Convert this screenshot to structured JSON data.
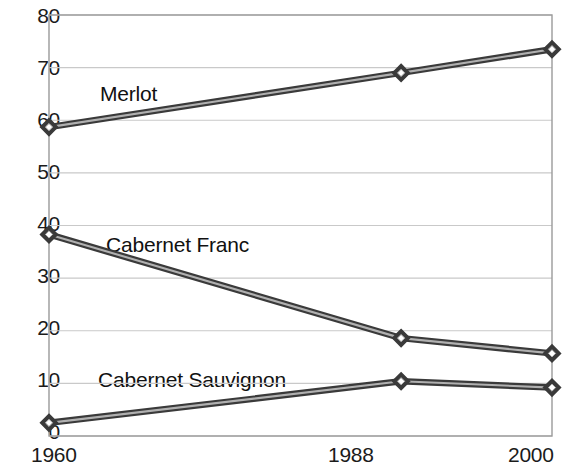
{
  "chart_data": {
    "type": "line",
    "title": "",
    "subtitle": "",
    "xlabel": "",
    "ylabel": "",
    "x": [
      1960,
      1988,
      2000
    ],
    "categories": [
      "1960",
      "1988",
      "2000"
    ],
    "xtick_labels": [
      "1960",
      "1988",
      "2000"
    ],
    "ytick_labels": [
      "0",
      "10",
      "20",
      "30",
      "40",
      "50",
      "60",
      "70",
      "80"
    ],
    "ytick_values": [
      0,
      10,
      20,
      30,
      40,
      50,
      60,
      70,
      80
    ],
    "ylim": [
      0,
      80
    ],
    "xlim": [
      1960,
      2000
    ],
    "grid": "horizontal",
    "legend": "inline-labels",
    "series": [
      {
        "name": "Merlot",
        "values": [
          58.7,
          69.0,
          73.5
        ],
        "color": "#3a3a3a",
        "marker": "diamond"
      },
      {
        "name": "Cabernet Franc",
        "values": [
          38.3,
          18.6,
          15.7
        ],
        "color": "#3a3a3a",
        "marker": "diamond"
      },
      {
        "name": "Cabernet Sauvignon",
        "values": [
          2.5,
          10.4,
          9.2
        ],
        "color": "#3a3a3a",
        "marker": "diamond"
      }
    ],
    "annotations": [
      {
        "text": "Merlot",
        "series": "Merlot"
      },
      {
        "text": "Cabernet Franc",
        "series": "Cabernet Franc"
      },
      {
        "text": "Cabernet Sauvignon",
        "series": "Cabernet Sauvignon"
      }
    ],
    "colors": {
      "line": "#3a3a3a",
      "line_highlight": "#b0b0b0",
      "grid": "#c9c9c9",
      "axis": "#9a9a9a",
      "text": "#1b1b1b",
      "background": "#ffffff"
    }
  },
  "axes": {
    "y_ticks": [
      {
        "label": "80",
        "value": 80
      },
      {
        "label": "70",
        "value": 70
      },
      {
        "label": "60",
        "value": 60
      },
      {
        "label": "50",
        "value": 50
      },
      {
        "label": "40",
        "value": 40
      },
      {
        "label": "30",
        "value": 30
      },
      {
        "label": "20",
        "value": 20
      },
      {
        "label": "10",
        "value": 10
      },
      {
        "label": "0",
        "value": 0
      }
    ],
    "x_ticks": [
      {
        "label": "1960",
        "value": 1960
      },
      {
        "label": "1988",
        "value": 1988
      },
      {
        "label": "2000",
        "value": 2000
      }
    ]
  }
}
